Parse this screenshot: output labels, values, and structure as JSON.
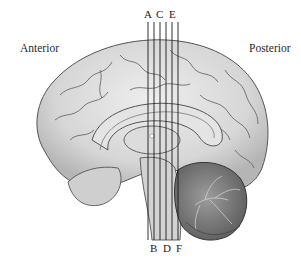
{
  "diagram": {
    "orientation_labels": {
      "anterior": "Anterior",
      "posterior": "Posterior"
    },
    "section_lines": {
      "top_labels": [
        "A",
        "C",
        "E"
      ],
      "bottom_labels": [
        "B",
        "D",
        "F"
      ],
      "count": 6
    },
    "structures": [
      "cerebrum",
      "corpus callosum",
      "thalamus",
      "brainstem",
      "cerebellum"
    ],
    "colors": {
      "brain_fill": "#d9d9d9",
      "gyri_stroke": "#6a6a6a",
      "cerebellum_fill": "#8a8a8a",
      "line": "#1a1a1a"
    }
  }
}
